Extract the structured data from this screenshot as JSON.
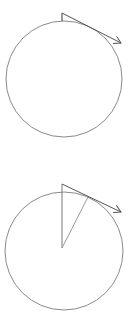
{
  "diagram": {
    "colors": {
      "circle_stroke": "#8a8a8a",
      "arrow_stroke": "#555555",
      "radius_stroke": "#9a9a9a",
      "background": "#ffffff"
    },
    "panels": [
      {
        "id": "top",
        "circle": {
          "cx": 64,
          "cy": 79,
          "r": 58
        },
        "tick": {
          "x": 62,
          "y1": 13,
          "y2": 21
        },
        "tangent_arrow": {
          "x1": 62,
          "y1": 13,
          "x2": 121,
          "y2": 43
        }
      },
      {
        "id": "bottom",
        "circle": {
          "cx": 64,
          "cy": 251,
          "r": 59
        },
        "radius_vertical": {
          "x1": 62,
          "y1": 248,
          "x2": 62,
          "y2": 184
        },
        "radius_angled": {
          "x1": 62,
          "y1": 248,
          "x2": 88,
          "y2": 197
        },
        "tangent_arrow": {
          "x1": 62,
          "y1": 184,
          "x2": 121,
          "y2": 212
        }
      }
    ]
  }
}
